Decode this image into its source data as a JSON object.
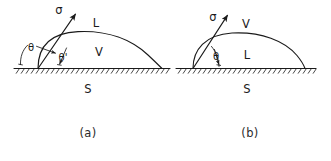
{
  "figure": {
    "kind": "contact-angle-wetting-diagram",
    "panels": [
      {
        "id": "a",
        "caption": "(a)",
        "caption_x": 88,
        "caption_y": 133,
        "baseline": {
          "x1": 14,
          "x2": 170,
          "y": 68
        },
        "droplet": {
          "left_x": 38,
          "right_x": 162,
          "apex_x": 104,
          "apex_y": 32
        },
        "tension_vector": {
          "label": "σ",
          "label_x": 59,
          "label_y": 10,
          "from_x": 38,
          "from_y": 68,
          "to_x": 76,
          "to_y": 13
        },
        "angles": [
          {
            "label": "θ",
            "label_x": 31,
            "label_y": 48
          },
          {
            "label": "θ'",
            "label_x": 63,
            "label_y": 58
          }
        ],
        "phases": [
          {
            "label": "L",
            "x": 96,
            "y": 23
          },
          {
            "label": "V",
            "x": 99,
            "y": 52
          },
          {
            "label": "S",
            "x": 88,
            "y": 89
          }
        ]
      },
      {
        "id": "b",
        "caption": "(b)",
        "caption_x": 250,
        "caption_y": 133,
        "baseline": {
          "x1": 176,
          "x2": 316,
          "y": 68
        },
        "droplet": {
          "left_x": 193,
          "right_x": 305,
          "apex_x": 249,
          "apex_y": 33
        },
        "tension_vector": {
          "label": "σ",
          "label_x": 213,
          "label_y": 17,
          "from_x": 193,
          "from_y": 68,
          "to_x": 228,
          "to_y": 14
        },
        "angles": [
          {
            "label": "θ",
            "label_x": 216,
            "label_y": 57
          }
        ],
        "phases": [
          {
            "label": "V",
            "x": 246,
            "y": 24
          },
          {
            "label": "L",
            "x": 247,
            "y": 55
          },
          {
            "label": "S",
            "x": 247,
            "y": 89
          }
        ]
      }
    ],
    "legend_symbols": {
      "sigma": "surface-tension-sigma",
      "theta": "contact-angle-theta",
      "theta_prime": "contact-angle-theta-prime",
      "L": "liquid-phase",
      "V": "vapor-phase",
      "S": "solid-phase"
    },
    "colors": {
      "ink": "#1a1a1a",
      "caption_ink": "#2b2b2b",
      "background": "#ffffff"
    }
  }
}
